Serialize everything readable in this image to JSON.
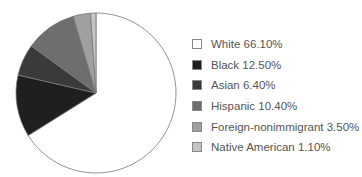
{
  "chart_data": {
    "type": "pie",
    "title": "",
    "categories": [
      "White",
      "Black",
      "Asian",
      "Hispanic",
      "Foreign-nonimmigrant",
      "Native American"
    ],
    "values": [
      66.1,
      12.5,
      6.4,
      10.4,
      3.5,
      1.1
    ],
    "colors": [
      "#ffffff",
      "#1f1f1f",
      "#3a3a3a",
      "#6e6e6e",
      "#a0a0a0",
      "#c4c4c4"
    ],
    "legend_position": "right",
    "legend": [
      "White 66.10%",
      "Black 12.50%",
      "Asian 6.40%",
      "Hispanic 10.40%",
      "Foreign-nonimmigrant 3.50%",
      "Native American 1.10%"
    ]
  }
}
